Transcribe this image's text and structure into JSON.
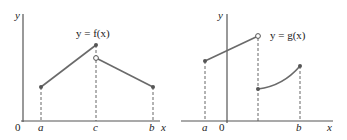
{
  "colors": {
    "axis": "#555555",
    "curve": "#6a6a6a",
    "point": "#555555",
    "dashed": "#555555",
    "text": "#222222"
  },
  "left_graph": {
    "function_label": "y = f(x)",
    "y_axis_label": "y",
    "x_axis_label": "x",
    "origin_label": "0",
    "tick_labels": [
      "a",
      "c",
      "b"
    ],
    "segments": [
      {
        "from": "a",
        "to": "c",
        "start": "filled",
        "end": "filled"
      },
      {
        "from": "c",
        "to": "b",
        "start": "open",
        "end": "filled"
      }
    ]
  },
  "right_graph": {
    "function_label": "y = g(x)",
    "y_axis_label": "y",
    "x_axis_label": "x",
    "origin_label": "0",
    "tick_labels": [
      "a",
      "b"
    ],
    "segments": [
      {
        "from": "a",
        "to": "jump",
        "start": "filled",
        "end": "open",
        "shape": "line"
      },
      {
        "from": "jump",
        "to": "b",
        "start": "filled",
        "end": "filled",
        "shape": "curve"
      }
    ]
  }
}
